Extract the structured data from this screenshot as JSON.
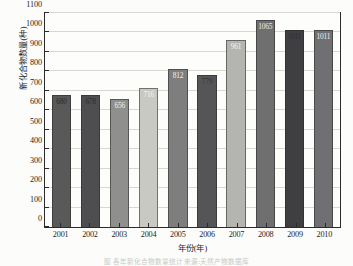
{
  "chart_data": {
    "type": "bar",
    "title": "",
    "xlabel": "年份(年)",
    "ylabel": "新化合物数量(种)",
    "categories": [
      "2001",
      "2002",
      "2003",
      "2004",
      "2005",
      "2006",
      "2007",
      "2008",
      "2009",
      "2010"
    ],
    "values": [
      680,
      678,
      656,
      716,
      812,
      779,
      961,
      1065,
      1011,
      1011
    ],
    "bar_labels": [
      "680",
      "678",
      "656",
      "716",
      "812",
      "779",
      "961",
      "1065",
      "1011",
      "1011"
    ],
    "bar_colors": [
      "#59595a",
      "#4e4e50",
      "#8f8f8d",
      "#c9c9c4",
      "#7e7e7e",
      "#555557",
      "#b4b4b0",
      "#6f6f70",
      "#3f3f42",
      "#707072"
    ],
    "bar_label_colors": [
      "#2b2b2b",
      "#2b2b2b",
      "#f2f2f0",
      "#f4f4f2",
      "#f0f0ee",
      "#343436",
      "#f4f4f2",
      "#ececea",
      "#2e2e31",
      "#efefed"
    ],
    "ylim": [
      0,
      1100
    ],
    "yticks": [
      "0",
      "100",
      "200",
      "300",
      "400",
      "500",
      "600",
      "700",
      "800",
      "900",
      "1000",
      "1100"
    ],
    "ytick_values": [
      0,
      100,
      200,
      300,
      400,
      500,
      600,
      700,
      800,
      900,
      1000,
      1100
    ],
    "grid": true,
    "legend": "none",
    "axis_color": "#2b2b2b",
    "grid_color": "#d8d8d2",
    "plot_background": "#fdfdfc"
  },
  "caption": {
    "text": "图 各年新化合物数量统计 来源:天然产物数据库"
  }
}
